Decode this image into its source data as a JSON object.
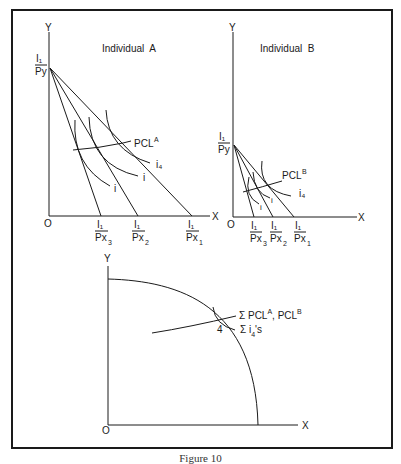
{
  "figure": {
    "caption": "Figure 10",
    "colors": {
      "ink": "#1a1a1a",
      "background": "#ffffff"
    }
  },
  "panels": {
    "individual_a": {
      "title": "Individual  A",
      "y_axis_label": "Y",
      "x_axis_label": "X",
      "origin_label": "O",
      "y_intercept": {
        "num": "I₁",
        "den": "Py"
      },
      "x_intercepts": [
        {
          "num": "I₁",
          "den": "Px",
          "sub": "3"
        },
        {
          "num": "I₁",
          "den": "Px",
          "sub": "2"
        },
        {
          "num": "I₁",
          "den": "Px",
          "sub": "1"
        }
      ],
      "pcl_label": "PCL",
      "pcl_sup": "A",
      "indifference_labels": [
        "i",
        "i",
        "i₄"
      ]
    },
    "individual_b": {
      "title": "Individual  B",
      "y_axis_label": "Y",
      "x_axis_label": "X",
      "origin_label": "O",
      "y_intercept": {
        "num": "I₁",
        "den": "Py"
      },
      "x_intercepts": [
        {
          "num": "I₁",
          "den": "Px",
          "sub": "3"
        },
        {
          "num": "I₁",
          "den": "Px",
          "sub": "2"
        },
        {
          "num": "I₁",
          "den": "Px",
          "sub": "1"
        }
      ],
      "pcl_label": "PCL",
      "pcl_sup": "B",
      "indifference_labels": [
        "i",
        "i",
        "i₄"
      ]
    },
    "aggregate": {
      "y_axis_label": "Y",
      "x_axis_label": "X",
      "origin_label": "O",
      "point_label": "4",
      "sum_pcl_label": "Σ PCL",
      "sum_pcl_sup_a": "A",
      "sum_pcl_mid": ", PCL",
      "sum_pcl_sup_b": "B",
      "sum_i_label": "Σ i",
      "sum_i_sub": "4",
      "sum_i_suffix": "'s"
    }
  }
}
